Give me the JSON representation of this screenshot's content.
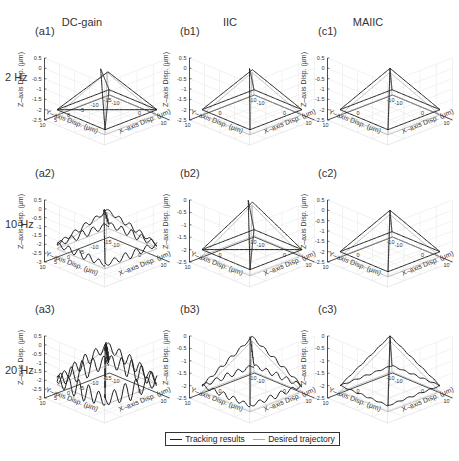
{
  "columns": [
    {
      "title": "DC-gain",
      "x": 57
    },
    {
      "title": "IIC",
      "x": 205
    },
    {
      "title": "MAIIC",
      "x": 343
    }
  ],
  "rows": [
    {
      "label": "2 Hz",
      "y": 77
    },
    {
      "label": "10 Hz",
      "y": 224
    },
    {
      "label": "20 Hz",
      "y": 370
    }
  ],
  "legend": {
    "tracking": {
      "label": "Tracking results",
      "color": "#222222"
    },
    "desired": {
      "label": "Desired trajectory",
      "color": "#aaaaaa"
    }
  },
  "panels": [
    {
      "id": "a1",
      "label": "(a1)",
      "left": 35,
      "top": 25,
      "zticks": [
        "0.5",
        "0",
        "-0.5",
        "-1",
        "-1.5",
        "-2",
        "-2.5"
      ],
      "yticks": [
        "10",
        "5",
        "0",
        "-5",
        "-10",
        "-15"
      ],
      "xticks": [
        "-10",
        "0",
        "10"
      ],
      "noise": 0,
      "skew": 1,
      "zmin": -2.5
    },
    {
      "id": "b1",
      "label": "(b1)",
      "left": 180,
      "top": 25,
      "zticks": [
        "0.5",
        "0",
        "-0.5",
        "-1",
        "-1.5",
        "-2",
        "-2.5"
      ],
      "yticks": [
        "10",
        "0",
        "-10"
      ],
      "xticks": [
        "-10",
        "0",
        "10"
      ],
      "noise": 0,
      "skew": 0.4,
      "zmin": -2.5
    },
    {
      "id": "c1",
      "label": "(c1)",
      "left": 318,
      "top": 25,
      "zticks": [
        "0.5",
        "0",
        "-0.5",
        "-1",
        "-1.5",
        "-2",
        "-2.5"
      ],
      "yticks": [
        "10",
        "0",
        "-10"
      ],
      "xticks": [
        "-10",
        "0",
        "10"
      ],
      "noise": 0,
      "skew": 0,
      "zmin": -2.5
    },
    {
      "id": "a2",
      "label": "(a2)",
      "left": 35,
      "top": 167,
      "zticks": [
        "0.5",
        "0",
        "-0.5",
        "-1",
        "-1.5",
        "-2",
        "-2.5",
        "-3"
      ],
      "yticks": [
        "10",
        "5",
        "0",
        "-5",
        "-10",
        "-15"
      ],
      "xticks": [
        "-10",
        "0",
        "10"
      ],
      "noise": 2,
      "skew": 0.5,
      "zmin": -3
    },
    {
      "id": "b2",
      "label": "(b2)",
      "left": 180,
      "top": 167,
      "zticks": [
        "0",
        "-0.5",
        "-1",
        "-1.5",
        "-2",
        "-2.5"
      ],
      "yticks": [
        "10",
        "0",
        "-10"
      ],
      "xticks": [
        "-10",
        "0",
        "10"
      ],
      "noise": 0,
      "skew": 0.6,
      "zmin": -2.5
    },
    {
      "id": "c2",
      "label": "(c2)",
      "left": 318,
      "top": 167,
      "zticks": [
        "0.5",
        "0",
        "-0.5",
        "-1",
        "-1.5",
        "-2",
        "-2.5"
      ],
      "yticks": [
        "10",
        "0",
        "-10"
      ],
      "xticks": [
        "-10",
        "0",
        "10"
      ],
      "noise": 0,
      "skew": 0,
      "zmin": -2.5
    },
    {
      "id": "a3",
      "label": "(a3)",
      "left": 35,
      "top": 303,
      "zticks": [
        "0.5",
        "0",
        "-0.5",
        "-1",
        "-1.5",
        "-2",
        "-2.5",
        "-3"
      ],
      "yticks": [
        "10",
        "5",
        "0",
        "-5",
        "-10",
        "-15"
      ],
      "xticks": [
        "-10",
        "0",
        "10"
      ],
      "noise": 5,
      "skew": 0.3,
      "zmin": -3
    },
    {
      "id": "b3",
      "label": "(b3)",
      "left": 180,
      "top": 303,
      "zticks": [
        "0",
        "-0.5",
        "-1",
        "-1.5",
        "-2",
        "-2.5"
      ],
      "yticks": [
        "10",
        "0",
        "-10"
      ],
      "xticks": [
        "-10",
        "0",
        "10"
      ],
      "noise": 1,
      "skew": 0.3,
      "zmin": -2.5
    },
    {
      "id": "c3",
      "label": "(c3)",
      "left": 318,
      "top": 303,
      "zticks": [
        "0",
        "-0.5",
        "-1",
        "-1.5",
        "-2",
        "-2.5"
      ],
      "yticks": [
        "10",
        "0",
        "-10"
      ],
      "xticks": [
        "-10",
        "0",
        "10"
      ],
      "noise": 0.3,
      "skew": 0,
      "zmin": -2.5
    }
  ],
  "axis_labels": {
    "x": "X–axis Disp. (μm)",
    "y": "Y–axis Disp. (μm)",
    "z": "Z–axis Disp. (μm)"
  },
  "chart_data": {
    "type": "line",
    "xlabel": "X–axis Disp. (μm)",
    "ylabel": "Y–axis Disp. (μm)",
    "zlabel": "Z–axis Disp. (μm)",
    "grid": true,
    "legend_position": "bottom",
    "legend": [
      "Tracking results",
      "Desired trajectory"
    ],
    "columns": [
      "DC-gain",
      "IIC",
      "MAIIC"
    ],
    "rows": [
      "2 Hz",
      "10 Hz",
      "20 Hz"
    ],
    "desired_trajectory": {
      "shape": "square pyramid",
      "apex": [
        0,
        0,
        0
      ],
      "base_corners": [
        [
          -10,
          -10,
          -2
        ],
        [
          10,
          -10,
          -2
        ],
        [
          10,
          10,
          -2
        ],
        [
          -10,
          10,
          -2
        ]
      ]
    },
    "subplots": [
      {
        "id": "a1",
        "method": "DC-gain",
        "freq": "2 Hz",
        "zlim": [
          -2.5,
          0.5
        ],
        "ylim": [
          -15,
          10
        ],
        "xlim": [
          -10,
          10
        ],
        "tracking": "distorted, skewed apex"
      },
      {
        "id": "b1",
        "method": "IIC",
        "freq": "2 Hz",
        "zlim": [
          -2.5,
          0.5
        ],
        "ylim": [
          -10,
          10
        ],
        "xlim": [
          -10,
          10
        ],
        "tracking": "close, small offset"
      },
      {
        "id": "c1",
        "method": "MAIIC",
        "freq": "2 Hz",
        "zlim": [
          -2.5,
          0.5
        ],
        "ylim": [
          -10,
          10
        ],
        "xlim": [
          -10,
          10
        ],
        "tracking": "overlaps desired"
      },
      {
        "id": "a2",
        "method": "DC-gain",
        "freq": "10 Hz",
        "zlim": [
          -3,
          0.5
        ],
        "ylim": [
          -15,
          10
        ],
        "xlim": [
          -10,
          10
        ],
        "tracking": "oscillatory"
      },
      {
        "id": "b2",
        "method": "IIC",
        "freq": "10 Hz",
        "zlim": [
          -2.5,
          0
        ],
        "ylim": [
          -10,
          10
        ],
        "xlim": [
          -10,
          10
        ],
        "tracking": "close, offset"
      },
      {
        "id": "c2",
        "method": "MAIIC",
        "freq": "10 Hz",
        "zlim": [
          -2.5,
          0.5
        ],
        "ylim": [
          -10,
          10
        ],
        "xlim": [
          -10,
          10
        ],
        "tracking": "overlaps desired"
      },
      {
        "id": "a3",
        "method": "DC-gain",
        "freq": "20 Hz",
        "zlim": [
          -3,
          0.5
        ],
        "ylim": [
          -15,
          10
        ],
        "xlim": [
          -10,
          10
        ],
        "tracking": "strong oscillation"
      },
      {
        "id": "b3",
        "method": "IIC",
        "freq": "20 Hz",
        "zlim": [
          -2.5,
          0
        ],
        "ylim": [
          -10,
          10
        ],
        "xlim": [
          -10,
          10
        ],
        "tracking": "mild ripple"
      },
      {
        "id": "c3",
        "method": "MAIIC",
        "freq": "20 Hz",
        "zlim": [
          -2.5,
          0
        ],
        "ylim": [
          -10,
          10
        ],
        "xlim": [
          -10,
          10
        ],
        "tracking": "nearly overlaps desired"
      }
    ]
  }
}
